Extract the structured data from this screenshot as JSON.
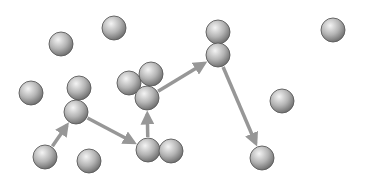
{
  "diagram": {
    "colors": {
      "background": "#ffffff",
      "sphere_highlight": "#f4f4f4",
      "sphere_mid": "#b4b4b4",
      "sphere_shadow": "#6e6e6e",
      "sphere_outline": "#5a5a5a",
      "arrow": "#8c8c8c"
    },
    "sphere_radius": 12,
    "spheres": [
      {
        "id": "s1",
        "x": 61,
        "y": 44
      },
      {
        "id": "s2",
        "x": 114,
        "y": 28
      },
      {
        "id": "s3",
        "x": 31,
        "y": 93
      },
      {
        "id": "s4",
        "x": 79,
        "y": 88
      },
      {
        "id": "s5",
        "x": 76,
        "y": 112
      },
      {
        "id": "s6",
        "x": 129,
        "y": 83
      },
      {
        "id": "s7",
        "x": 151,
        "y": 74
      },
      {
        "id": "s8",
        "x": 147,
        "y": 98
      },
      {
        "id": "s9",
        "x": 218,
        "y": 32
      },
      {
        "id": "s10",
        "x": 218,
        "y": 55
      },
      {
        "id": "s11",
        "x": 333,
        "y": 30
      },
      {
        "id": "s12",
        "x": 282,
        "y": 101
      },
      {
        "id": "s13",
        "x": 45,
        "y": 157
      },
      {
        "id": "s14",
        "x": 89,
        "y": 161
      },
      {
        "id": "s15",
        "x": 148,
        "y": 150
      },
      {
        "id": "s16",
        "x": 171,
        "y": 151
      },
      {
        "id": "s17",
        "x": 262,
        "y": 158
      }
    ],
    "arrows": [
      {
        "from": "s13",
        "to": "s5"
      },
      {
        "from": "s5",
        "to": "s15"
      },
      {
        "from": "s15",
        "to": "s8"
      },
      {
        "from": "s8",
        "to": "s10"
      },
      {
        "from": "s10",
        "to": "s17"
      }
    ]
  }
}
